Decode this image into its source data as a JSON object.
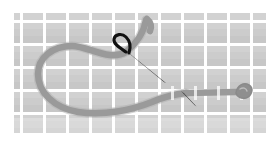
{
  "canvas": {
    "width": 270,
    "height": 142,
    "background_color": "#ffffff",
    "title": "Needle and thread on gridded fabric"
  },
  "fabric": {
    "name": "gridded-fabric",
    "x": 14,
    "y": 13,
    "width": 252,
    "height": 120,
    "cell_color": "#c9c9c9",
    "cell_color_light": "#d4d4d4",
    "gridline_color": "#ffffff",
    "cell_pitch": 23.0,
    "gridline_width": 3.0,
    "columns": 11,
    "rows": 5
  },
  "thread": {
    "name": "gray-thread",
    "color": "#9a9a9a",
    "color_light": "#b0b0b0",
    "color_dark": "#8a8a8a",
    "stroke_width": 6.5,
    "description": "Large open loop at left rising to a hooked tip at top center, then running right as a straight horizontal strand ending in a small knot",
    "loop_path": "M 146 20 C 144 32 136 44 126 52 C 110 62 88 46 72 46 C 52 46 38 58 38 74 C 38 92 54 108 78 112 C 104 116 132 110 152 102 C 166 96 176 94 186 93",
    "tip_hook_path": "M 146 20 C 150 24 152 28 150 32",
    "straight_path": "M 186 93 L 236 92",
    "knot_path": "M 236 92 C 240 86 248 85 250 89 C 252 93 248 98 243 97 C 239 96 237 95 236 92 Z",
    "knot_color": "#8f8f8f"
  },
  "needles": [
    {
      "name": "large-needle",
      "color": "#111111",
      "eye_cx": 124,
      "eye_cy": 46,
      "eye_rx": 9,
      "eye_ry": 7,
      "eye_rotation": -28,
      "eye_stroke_width": 3.0,
      "shaft_path": "M 128 52 L 166 83",
      "shaft_width_top": 4.0,
      "shaft_width_tip": 0.6,
      "point_x": 166,
      "point_y": 83
    },
    {
      "name": "small-needle-point",
      "color": "#1a1a1a",
      "shaft_path": "M 182 92 L 196 106",
      "shaft_width_top": 2.6,
      "shaft_width_tip": 0.5,
      "point_x": 196,
      "point_y": 106
    }
  ],
  "labels": {
    "alt_text": "Illustration of a sewing needle threaded with gray thread looping across a gray checkered fabric"
  }
}
